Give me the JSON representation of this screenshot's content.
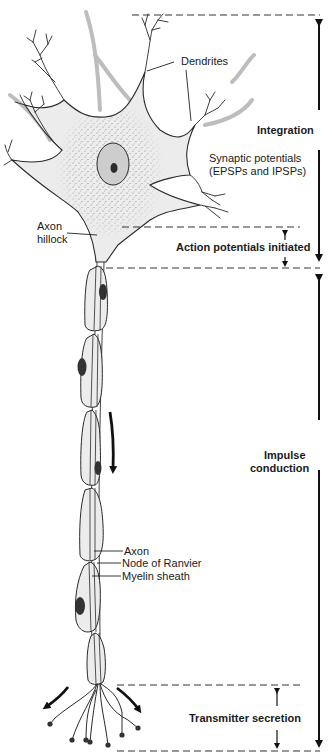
{
  "figure": {
    "top_caption_cutoff": "",
    "colors": {
      "outline": "#2a2a2a",
      "cell_fill": "#ececec",
      "nucleus_fill": "#c9c9c9",
      "nucleolus": "#2b2b2b",
      "schwann_nucleus": "#3a3a3a",
      "gray_process": "#b8b8b8",
      "dash_line": "#333333",
      "arrow": "#111111"
    }
  },
  "structure_labels": {
    "dendrites": "Dendrites",
    "axon_hillock_line1": "Axon",
    "axon_hillock_line2": "hillock",
    "synaptic_line1": "Synaptic potentials",
    "synaptic_line2": "(EPSPs and IPSPs)",
    "axon": "Axon",
    "node_of_ranvier": "Node of Ranvier",
    "myelin_sheath": "Myelin sheath"
  },
  "region_labels": {
    "integration": "Integration",
    "action_potentials": "Action potentials initiated",
    "impulse_line1": "Impulse",
    "impulse_line2": "conduction",
    "transmitter": "Transmitter secretion"
  }
}
